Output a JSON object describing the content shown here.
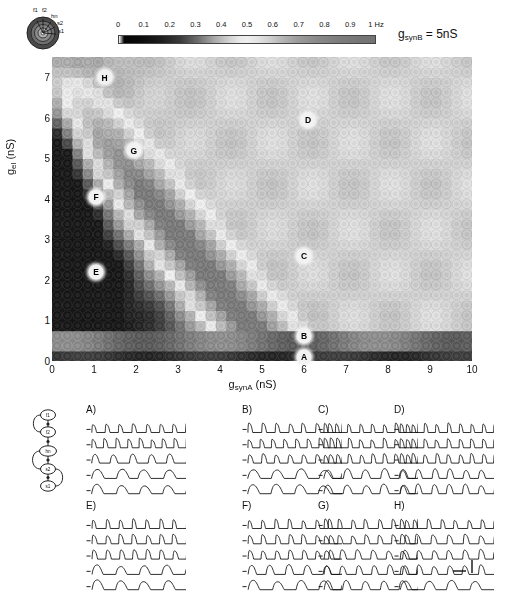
{
  "figure": {
    "condition_label": "g_synB = 5nS",
    "condition_base": "g",
    "condition_sub": "synB",
    "condition_value": "= 5nS"
  },
  "schematic": {
    "name": "neuron-cross-section",
    "labels": [
      "f1",
      "f2",
      "hn",
      "s2",
      "s1"
    ]
  },
  "colorbar": {
    "unit": "Hz",
    "ticks": [
      "0",
      "0.1",
      "0.2",
      "0.3",
      "0.4",
      "0.5",
      "0.6",
      "0.7",
      "0.8",
      "0.9",
      "1 Hz"
    ],
    "tick_values": [
      0,
      0.1,
      0.2,
      0.3,
      0.4,
      0.5,
      0.6,
      0.7,
      0.8,
      0.9,
      1.0
    ],
    "vmin": 0,
    "vmax": 1
  },
  "chart_data": {
    "type": "heatmap",
    "title": "",
    "xlabel": "g_synA (nS)",
    "ylabel": "g_el (nS)",
    "xlabel_base": "g",
    "xlabel_sub": "synA",
    "xlabel_unit": "(nS)",
    "ylabel_base": "g",
    "ylabel_sub": "el",
    "ylabel_unit": "(nS)",
    "xlim": [
      0,
      10
    ],
    "ylim": [
      0,
      7.5
    ],
    "xticks": [
      0,
      1,
      2,
      3,
      4,
      5,
      6,
      7,
      8,
      9,
      10
    ],
    "yticks": [
      0,
      1,
      2,
      3,
      4,
      5,
      6,
      7
    ],
    "grid": false,
    "cells_x": 41,
    "cells_y": 30,
    "colorbar_label": "Hz",
    "zlim": [
      0,
      1
    ],
    "markers": [
      {
        "label": "A",
        "x": 6.0,
        "y": 0.1
      },
      {
        "label": "B",
        "x": 6.0,
        "y": 0.62
      },
      {
        "label": "C",
        "x": 6.0,
        "y": 2.6
      },
      {
        "label": "D",
        "x": 6.1,
        "y": 5.95
      },
      {
        "label": "E",
        "x": 1.05,
        "y": 2.2
      },
      {
        "label": "F",
        "x": 1.05,
        "y": 4.05
      },
      {
        "label": "G",
        "x": 1.95,
        "y": 5.2
      },
      {
        "label": "H",
        "x": 1.25,
        "y": 7.0
      }
    ]
  },
  "circuit": {
    "name": "five-cell-chain",
    "nodes": [
      "f1",
      "f2",
      "hn",
      "s2",
      "s1"
    ]
  },
  "trace_panels": [
    {
      "label": "A)",
      "traces": 5
    },
    {
      "label": "B)",
      "traces": 5
    },
    {
      "label": "C)",
      "traces": 5
    },
    {
      "label": "D)",
      "traces": 5
    },
    {
      "label": "E)",
      "traces": 5
    },
    {
      "label": "F)",
      "traces": 5
    },
    {
      "label": "G)",
      "traces": 5
    },
    {
      "label": "H)",
      "traces": 5
    }
  ],
  "scale_bar": {
    "name": "time-voltage-scale-bar",
    "label": ""
  }
}
